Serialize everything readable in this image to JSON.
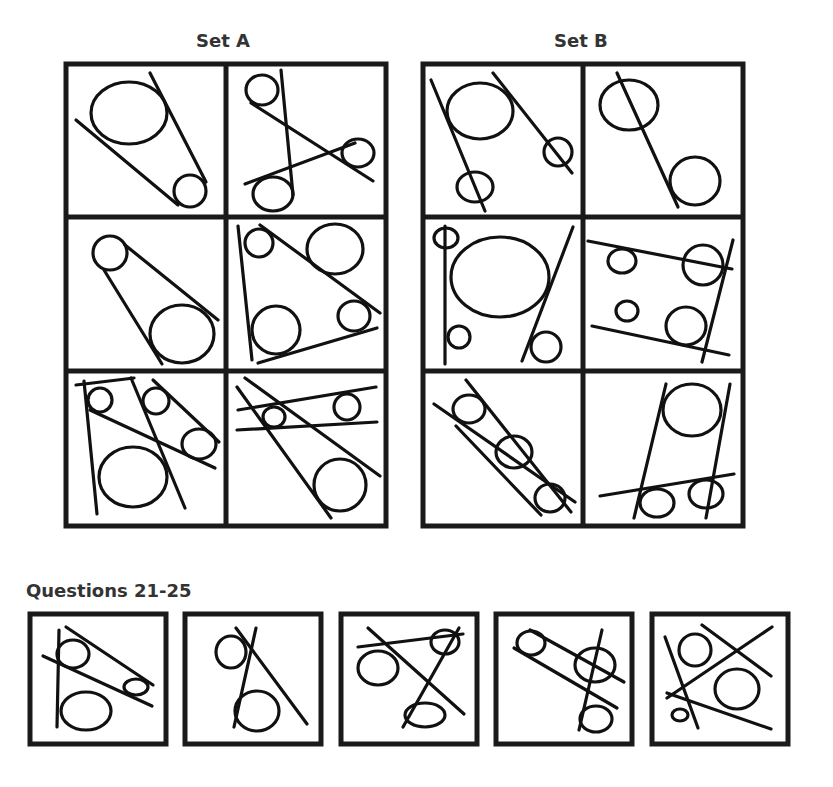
{
  "set_a": {
    "title": "Set A",
    "panels": 6
  },
  "set_b": {
    "title": "Set B",
    "panels": 6
  },
  "questions": {
    "title": "Questions 21-25",
    "items": [
      21,
      22,
      23,
      24,
      25
    ]
  }
}
